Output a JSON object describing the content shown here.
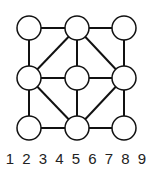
{
  "diagram": {
    "type": "graph",
    "nodes": [
      {
        "id": "tl",
        "x": 29,
        "y": 28
      },
      {
        "id": "tm",
        "x": 77,
        "y": 28
      },
      {
        "id": "tr",
        "x": 124,
        "y": 28
      },
      {
        "id": "ml",
        "x": 29,
        "y": 78
      },
      {
        "id": "mm",
        "x": 77,
        "y": 78
      },
      {
        "id": "mr",
        "x": 124,
        "y": 78
      },
      {
        "id": "bl",
        "x": 29,
        "y": 128
      },
      {
        "id": "bm",
        "x": 77,
        "y": 128
      },
      {
        "id": "br",
        "x": 124,
        "y": 128
      }
    ],
    "edges": [
      [
        "tl",
        "tm"
      ],
      [
        "tm",
        "tr"
      ],
      [
        "tl",
        "ml"
      ],
      [
        "ml",
        "bl"
      ],
      [
        "tr",
        "mr"
      ],
      [
        "mr",
        "br"
      ],
      [
        "bl",
        "bm"
      ],
      [
        "bm",
        "br"
      ],
      [
        "ml",
        "mm"
      ],
      [
        "mm",
        "mr"
      ],
      [
        "tm",
        "mm"
      ],
      [
        "mm",
        "bm"
      ],
      [
        "tm",
        "ml"
      ],
      [
        "tm",
        "mr"
      ],
      [
        "ml",
        "bm"
      ],
      [
        "mr",
        "bm"
      ]
    ],
    "node_radius": 12,
    "stroke_color": "#111111",
    "fill_color": "#ffffff"
  },
  "labels": [
    "1",
    "2",
    "3",
    "4",
    "5",
    "6",
    "7",
    "8",
    "9"
  ]
}
